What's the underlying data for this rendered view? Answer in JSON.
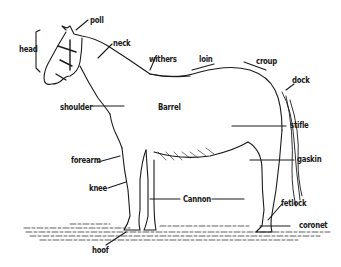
{
  "colors": {
    "ink": "#1a1a1a",
    "background": "#ffffff"
  },
  "labels": {
    "poll": "poll",
    "head": "head",
    "neck": "neck",
    "withers": "withers",
    "loin": "loin",
    "croup": "croup",
    "dock": "dock",
    "shoulder": "shoulder",
    "barrel": "Barrel",
    "stifle": "stifle",
    "forearm": "forearm",
    "gaskin": "gaskin",
    "knee": "knee",
    "cannon": "Cannon",
    "fetlock": "fetlock",
    "coronet": "coronet",
    "hoof": "hoof"
  }
}
